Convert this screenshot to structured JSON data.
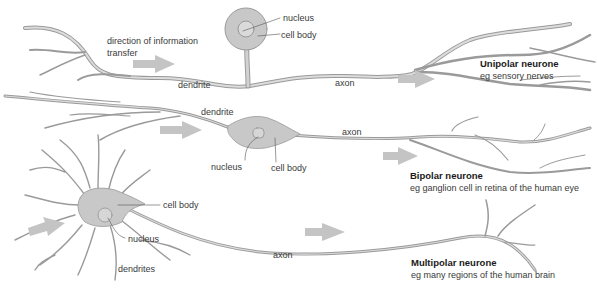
{
  "colors": {
    "fiber_fill": "#cfcfcf",
    "fiber_outline": "#9a9a9a",
    "body_fill": "#c8c8c8",
    "arrow_fill": "#c4c4c4",
    "label_line": "#555555",
    "text": "#3a3a3a"
  },
  "unipolar": {
    "title": "Unipolar neurone",
    "example": "eg sensory nerves",
    "labels": {
      "direction": "direction of information",
      "direction2": "transfer",
      "nucleus": "nucleus",
      "cell_body": "cell body",
      "dendrite": "dendrite",
      "axon": "axon"
    }
  },
  "bipolar": {
    "title": "Bipolar neurone",
    "example": "eg ganglion cell in retina of  the human eye",
    "labels": {
      "dendrite": "dendrite",
      "nucleus": "nucleus",
      "cell_body": "cell body",
      "axon": "axon"
    }
  },
  "multipolar": {
    "title": "Multipolar neurone",
    "example": "eg many regions of the human brain",
    "labels": {
      "cell_body": "cell body",
      "nucleus": "nucleus",
      "dendrites": "dendrites",
      "axon": "axon"
    }
  }
}
